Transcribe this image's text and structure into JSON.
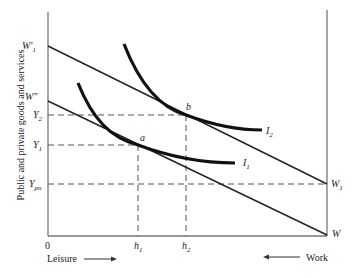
{
  "diagram": {
    "y_axis_label": "Public and private goods and services",
    "x_axis_left_label": "Leisure",
    "x_axis_right_label": "Work",
    "origin_label": "0",
    "budget_lines": [
      {
        "name": "W1-prime",
        "label_main": "W",
        "label_prime": "′",
        "label_sub": "1",
        "end_label_main": "W",
        "end_label_sub": "1"
      },
      {
        "name": "W-double-prime",
        "label_main": "W",
        "label_prime": "″",
        "end_label_main": "W"
      }
    ],
    "y_levels": [
      {
        "main": "Y",
        "sub": "2"
      },
      {
        "main": "Y",
        "sub": "1"
      },
      {
        "main": "Y",
        "sub": "pu"
      }
    ],
    "x_levels": [
      {
        "main": "h",
        "sub": "1"
      },
      {
        "main": "h",
        "sub": "2"
      }
    ],
    "indifference_curves": [
      {
        "main": "I",
        "sub": "1"
      },
      {
        "main": "I",
        "sub": "2"
      }
    ],
    "points": [
      {
        "label": "a"
      },
      {
        "label": "b"
      }
    ]
  }
}
